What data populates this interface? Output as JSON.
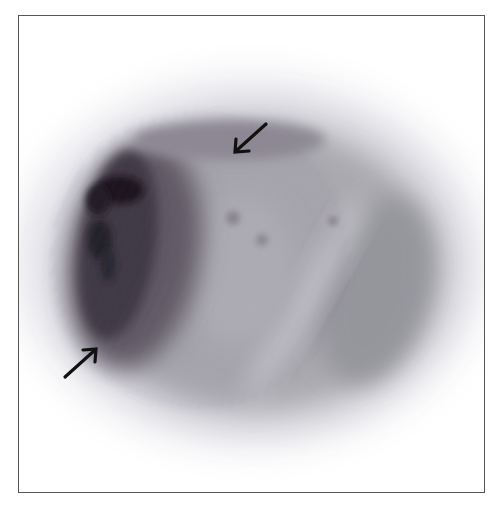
{
  "figure": {
    "type": "grayscale tomographic slice (PET-like) with annotation arrows",
    "frame": {
      "x": 18,
      "y": 15,
      "width": 467,
      "height": 478,
      "border_color": "#555555"
    },
    "colors": {
      "background": "#ffffff",
      "halo": "#e4e4ea",
      "body": "#a9a9ae",
      "mid": "#8f8f96",
      "dark_region": "#2e2a33",
      "hot_spot": "#121016",
      "arrow": "#111111"
    },
    "annotations": [
      {
        "name": "arrow-top",
        "direction": "down-left",
        "tip": [
          234,
          153
        ],
        "tail": [
          266,
          124
        ]
      },
      {
        "name": "arrow-bottom-left",
        "direction": "up-right",
        "tip": [
          97,
          348
        ],
        "tail": [
          65,
          377
        ]
      }
    ]
  }
}
